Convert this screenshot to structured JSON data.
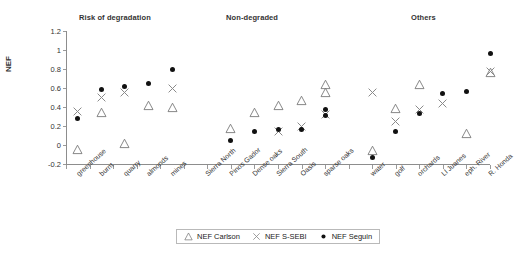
{
  "chart": {
    "ylabel": "NEF",
    "yticks": [
      "1.2",
      "1",
      "0.8",
      "0.6",
      "0.4",
      "0.2",
      "0",
      "-0.2"
    ],
    "group_titles": [
      "Risk of degradation",
      "Non-degraded",
      "Others"
    ]
  },
  "legend": {
    "items": [
      {
        "label": "NEF Carlson",
        "marker": "triangle"
      },
      {
        "label": "NEF S-SEBI",
        "marker": "cross"
      },
      {
        "label": "NEF Seguin",
        "marker": "circle"
      }
    ]
  },
  "chart_data": {
    "type": "scatter",
    "title": "",
    "xlabel": "",
    "ylabel": "NEF",
    "ylim": [
      -0.2,
      1.2
    ],
    "ytick_step": 0.2,
    "grid": false,
    "legend_position": "bottom",
    "groups": [
      {
        "name": "Risk of degradation",
        "categories": [
          "greenhouse",
          "burnt",
          "quarry",
          "almonds",
          "mines"
        ]
      },
      {
        "name": "Non-degraded",
        "categories": [
          "Sierra North",
          "Pinos Gador",
          "Dense oaks",
          "Sierra South",
          "Oasis",
          "sparse oaks"
        ]
      },
      {
        "name": "Others",
        "categories": [
          "water",
          "golf",
          "orchards",
          "Ll Juanes",
          "eph. River",
          "R. Honda"
        ]
      }
    ],
    "categories": [
      "greenhouse",
      "burnt",
      "quarry",
      "almonds",
      "mines",
      "Sierra North",
      "Pinos Gador",
      "Dense oaks",
      "Sierra South",
      "Oasis",
      "sparse oaks",
      "water",
      "golf",
      "orchards",
      "Ll Juanes",
      "eph. River",
      "R. Honda"
    ],
    "series": [
      {
        "name": "NEF Carlson",
        "marker": "triangle",
        "values": [
          -0.02,
          0.37,
          0.05,
          0.45,
          0.43,
          null,
          0.21,
          0.37,
          0.45,
          0.5,
          0.58,
          -0.03,
          0.42,
          0.67,
          null,
          0.15,
          0.8
        ]
      },
      {
        "name": "NEF S-SEBI",
        "marker": "cross",
        "values": [
          0.38,
          0.53,
          0.58,
          null,
          0.63,
          null,
          null,
          null,
          0.17,
          0.23,
          0.35,
          0.58,
          0.28,
          0.41,
          0.47,
          null,
          0.81
        ]
      },
      {
        "name": "NEF Seguin",
        "marker": "circle",
        "values": [
          0.31,
          0.62,
          0.65,
          0.68,
          0.83,
          null,
          0.08,
          0.17,
          0.19,
          0.2,
          0.34,
          -0.1,
          0.17,
          0.36,
          0.57,
          0.6,
          0.99
        ]
      }
    ],
    "extra_points": [
      {
        "series": "NEF Carlson",
        "category": "sparse oaks",
        "value": 0.67
      },
      {
        "series": "NEF Seguin",
        "category": "sparse oaks",
        "value": 0.41
      }
    ]
  }
}
